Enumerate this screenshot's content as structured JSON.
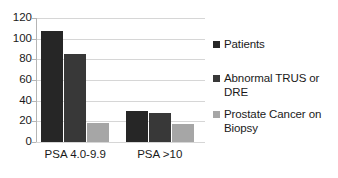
{
  "chart_data": {
    "type": "bar",
    "title": "",
    "subtitle": "",
    "xlabel": "",
    "ylabel": "",
    "categories": [
      "PSA 4.0-9.9",
      "PSA >10"
    ],
    "series": [
      {
        "name": "Patients",
        "color": "#262626",
        "values": [
          107,
          30
        ]
      },
      {
        "name": "Abnormal TRUS or DRE",
        "color": "#383838",
        "values": [
          85,
          28
        ]
      },
      {
        "name": "Prostate Cancer on Biopsy",
        "color": "#a6a6a6",
        "values": [
          18,
          17
        ]
      }
    ],
    "ylim": [
      0,
      120
    ],
    "yticks": [
      0,
      20,
      40,
      60,
      80,
      100,
      120
    ],
    "ytick_labels": [
      "0",
      "20",
      "40",
      "60",
      "80",
      "100",
      "120"
    ],
    "grid": true,
    "grid_axis": "y",
    "legend_position": "right",
    "legend": [
      {
        "label": "Patients",
        "color": "#262626"
      },
      {
        "label": "Abnormal TRUS or DRE",
        "color": "#383838"
      },
      {
        "label": "Prostate Cancer on Biopsy",
        "color": "#a6a6a6"
      }
    ],
    "colors": {
      "background": "#ffffff",
      "gridline": "#d6d6d6",
      "axis": "#b5b5b5",
      "text": "#1a1a1a"
    }
  }
}
